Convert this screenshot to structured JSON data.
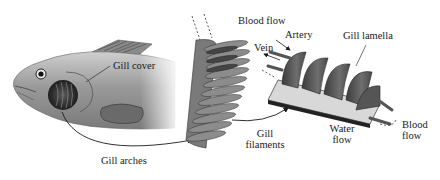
{
  "diagram": {
    "labels": {
      "gill_cover": "Gill cover",
      "gill_arches": "Gill arches",
      "gill_filaments_line1": "Gill",
      "gill_filaments_line2": "filaments",
      "blood_flow_top": "Blood flow",
      "artery": "Artery",
      "vein": "Vein",
      "gill_lamella": "Gill lamella",
      "water_flow_line1": "Water",
      "water_flow_line2": "flow",
      "blood_flow_right_line1": "Blood",
      "blood_flow_right_line2": "flow"
    },
    "colors": {
      "ink": "#1a1a1a",
      "fish_body": "#a8a8a8",
      "fish_dark": "#3a3a3a",
      "tissue": "#6a6a6a",
      "background": "#ffffff"
    }
  }
}
